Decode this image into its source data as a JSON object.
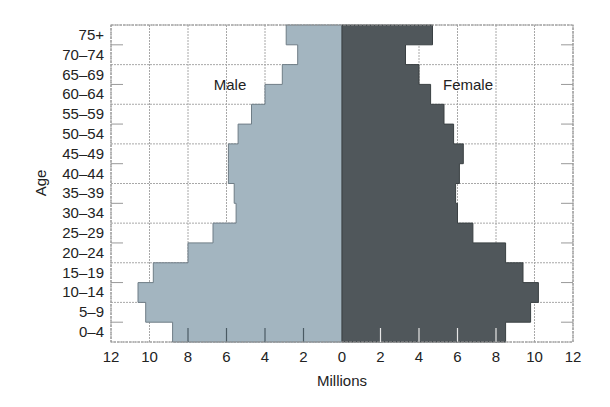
{
  "chart_data": {
    "type": "bar",
    "subtype": "population-pyramid",
    "title": "",
    "xlabel": "Millions",
    "ylabel": "Age",
    "xlim": [
      -12,
      12
    ],
    "x_ticks": [
      12,
      10,
      8,
      6,
      4,
      2,
      0,
      2,
      4,
      6,
      8,
      10,
      12
    ],
    "grid": true,
    "categories": [
      "0–4",
      "5–9",
      "10–14",
      "15–19",
      "20–24",
      "25–29",
      "30–34",
      "35–39",
      "40–44",
      "45–49",
      "50–54",
      "55–59",
      "60–64",
      "65–69",
      "70–74",
      "75+"
    ],
    "series": [
      {
        "name": "Male",
        "side": "left",
        "color": "#a3b5c0",
        "values": [
          8.8,
          10.2,
          10.6,
          9.8,
          8.0,
          6.7,
          5.5,
          5.6,
          5.9,
          5.9,
          5.4,
          4.7,
          4.0,
          3.1,
          2.3,
          2.9
        ]
      },
      {
        "name": "Female",
        "side": "right",
        "color": "#50575b",
        "values": [
          8.5,
          9.8,
          10.2,
          9.4,
          8.5,
          6.8,
          6.0,
          5.9,
          6.1,
          6.3,
          5.8,
          5.3,
          4.6,
          4.0,
          3.3,
          4.7
        ]
      }
    ],
    "annotations": [
      "Male",
      "Female"
    ]
  }
}
